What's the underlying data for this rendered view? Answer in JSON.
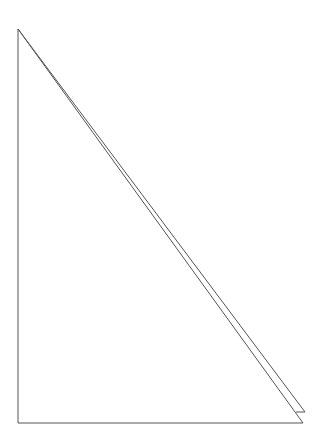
{
  "diagram": {
    "type": "line-drawing",
    "background": "#ffffff",
    "stroke_color": "#555555",
    "stroke_width": 1,
    "shapes": [
      {
        "name": "right-triangle",
        "points": [
          [
            18,
            29
          ],
          [
            18,
            423
          ],
          [
            303,
            423
          ]
        ]
      },
      {
        "name": "offset-hypotenuse",
        "points": [
          [
            18,
            29
          ],
          [
            305,
            412
          ],
          [
            296,
            412
          ]
        ]
      }
    ]
  }
}
